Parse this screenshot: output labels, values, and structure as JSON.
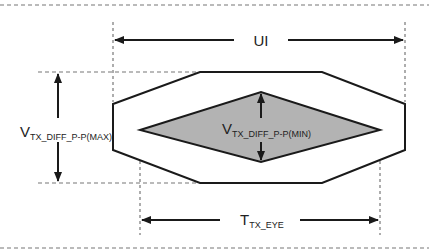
{
  "diagram": {
    "labels": {
      "ui": "UI",
      "v_max_main": "V",
      "v_max_sub": "TX_DIFF_P-P(MAX)",
      "v_min_main": "V",
      "v_min_sub": "TX_DIFF_P-P(MIN)",
      "t_eye_main": "T",
      "t_eye_sub": "TX_EYE"
    },
    "colors": {
      "line": "#1a1a1a",
      "dash": "#777777",
      "eye_fill": "#b3b3b3",
      "background": "#ffffff"
    },
    "shapes": {
      "outer_octagon": "Outer mask (max amplitude envelope)",
      "inner_diamond": "Inner eye opening (min amplitude mask)"
    }
  }
}
